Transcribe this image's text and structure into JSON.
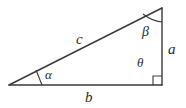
{
  "figure": {
    "name": "right-triangle-diagram",
    "background_color": "#ffffff",
    "stroke_color": "#3a3a3a",
    "label_color": "#2b2b2b",
    "sides": {
      "hypotenuse_label": "c",
      "base_label": "b",
      "vertical_label": "a"
    },
    "angles": {
      "left_label": "α",
      "top_label": "β",
      "interior_right_label": "θ",
      "right_angle_marker": "square"
    },
    "geometry": {
      "vertex_left": [
        9,
        85
      ],
      "vertex_top_right": [
        162,
        8
      ],
      "vertex_bottom_right": [
        162,
        85
      ],
      "right_angle_square": [
        154,
        77,
        8,
        8
      ]
    }
  }
}
